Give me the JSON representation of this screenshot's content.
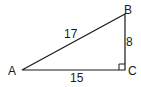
{
  "diagram": {
    "type": "right-triangle",
    "vertices": {
      "A": {
        "label": "A"
      },
      "B": {
        "label": "B"
      },
      "C": {
        "label": "C"
      }
    },
    "sides": {
      "AB": {
        "label": "17"
      },
      "BC": {
        "label": "8"
      },
      "AC": {
        "label": "15"
      }
    },
    "right_angle_at": "C",
    "stroke_color": "#1a1a1a"
  }
}
